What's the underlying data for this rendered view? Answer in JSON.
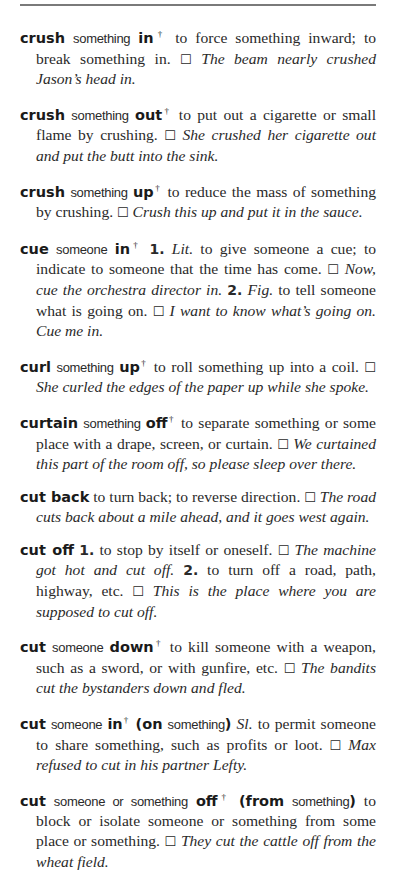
{
  "entries": [
    {
      "headword": "crush",
      "arg": "something",
      "particle": "in",
      "dagger": "†",
      "def": "to force something inward; to break something in.",
      "box": "☐",
      "example": "The beam nearly crushed Jason’s head in."
    },
    {
      "headword": "crush",
      "arg": "something",
      "particle": "out",
      "dagger": "†",
      "def": "to put out a cigarette or small flame by crushing.",
      "box": "☐",
      "example": "She crushed her cigarette out and put the butt into the sink."
    },
    {
      "headword": "crush",
      "arg": "something",
      "particle": "up",
      "dagger": "†",
      "def": "to reduce the mass of something by crushing.",
      "box": "☐",
      "example": "Crush this up and put it in the sauce."
    },
    {
      "headword": "cue",
      "arg": "someone",
      "particle": "in",
      "dagger": "†",
      "sense1_num": "1.",
      "sense1_label": "Lit.",
      "sense1_def": "to give someone a cue; to indicate to someone that the time has come.",
      "box1": "☐",
      "sense1_example": "Now, cue the orchestra director in.",
      "sense2_num": "2.",
      "sense2_label": "Fig.",
      "sense2_def": "to tell someone what is going on.",
      "box2": "☐",
      "sense2_example": "I want to know what’s going on. Cue me in."
    },
    {
      "headword": "curl",
      "arg": "something",
      "particle": "up",
      "dagger": "†",
      "def": "to roll something up into a coil.",
      "box": "☐",
      "example": "She curled the edges of the paper up while she spoke."
    },
    {
      "headword": "curtain",
      "arg": "something",
      "particle": "off",
      "dagger": "†",
      "def": "to separate something or some place with a drape, screen, or curtain.",
      "box": "☐",
      "example": "We curtained this part of the room off, so please sleep over there."
    },
    {
      "headword": "cut back",
      "def": "to turn back; to reverse direction.",
      "box": "☐",
      "example": "The road cuts back about a mile ahead, and it goes west again."
    },
    {
      "headword": "cut off",
      "sense1_num": "1.",
      "sense1_def": "to stop by itself or oneself.",
      "box1": "☐",
      "sense1_example": "The machine got hot and cut off.",
      "sense2_num": "2.",
      "sense2_def": "to turn off a road, path, highway, etc.",
      "box2": "☐",
      "sense2_example": "This is the place where you are supposed to cut off."
    },
    {
      "headword": "cut",
      "arg": "someone",
      "particle": "down",
      "dagger": "†",
      "def": "to kill someone with a weapon, such as a sword, or with gunfire, etc.",
      "box": "☐",
      "example": "The bandits cut the bystanders down and fled."
    },
    {
      "headword": "cut",
      "arg": "someone",
      "particle": "in",
      "dagger": "†",
      "opt_open": "(on",
      "opt_arg": "something",
      "opt_close": ")",
      "label": "Sl.",
      "def": "to permit someone to share something, such as profits or loot.",
      "box": "☐",
      "example": "Max refused to cut in his partner Lefty."
    },
    {
      "headword": "cut",
      "arg": "someone or something",
      "particle": "off",
      "dagger": "†",
      "opt_open": "(from",
      "opt_arg": "something",
      "opt_close": ")",
      "def": "to block or isolate someone or something from some place or something.",
      "box": "☐",
      "example": "They cut the cattle off from the wheat field."
    }
  ]
}
